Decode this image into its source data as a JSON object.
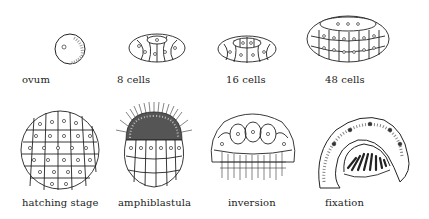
{
  "stages": [
    {
      "id": "ovum",
      "label": "ovum"
    },
    {
      "id": "8-cells",
      "label": "8 cells"
    },
    {
      "id": "16-cells",
      "label": "16 cells"
    },
    {
      "id": "48-cells",
      "label": "48 cells"
    },
    {
      "id": "hatching-stage",
      "label": "hatching stage"
    },
    {
      "id": "amphiblastula",
      "label": "amphiblastula"
    },
    {
      "id": "inversion",
      "label": "inversion"
    },
    {
      "id": "fixation",
      "label": "fixation"
    }
  ],
  "colors": {
    "ink": "#222222",
    "background": "#ffffff"
  }
}
